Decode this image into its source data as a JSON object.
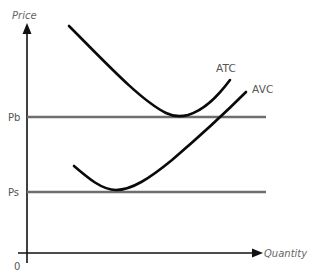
{
  "diagram": {
    "type": "economics-cost-curves",
    "axes": {
      "y_label": "Price",
      "x_label": "Quantity",
      "origin_label": "0"
    },
    "price_levels": [
      {
        "id": "pb",
        "label": "Pb",
        "meaning": "break-even price (minimum ATC)"
      },
      {
        "id": "ps",
        "label": "Ps",
        "meaning": "shutdown price (minimum AVC)"
      }
    ],
    "curves": [
      {
        "id": "atc",
        "label": "ATC",
        "shape": "U-shaped",
        "minimum_touches": "Pb"
      },
      {
        "id": "avc",
        "label": "AVC",
        "shape": "U-shaped",
        "minimum_touches": "Ps"
      }
    ],
    "colors": {
      "axes": "#111111",
      "price_lines": "#6e6e6e",
      "curves": "#0a0a0a",
      "labels": "#555555",
      "background": "#ffffff"
    }
  }
}
